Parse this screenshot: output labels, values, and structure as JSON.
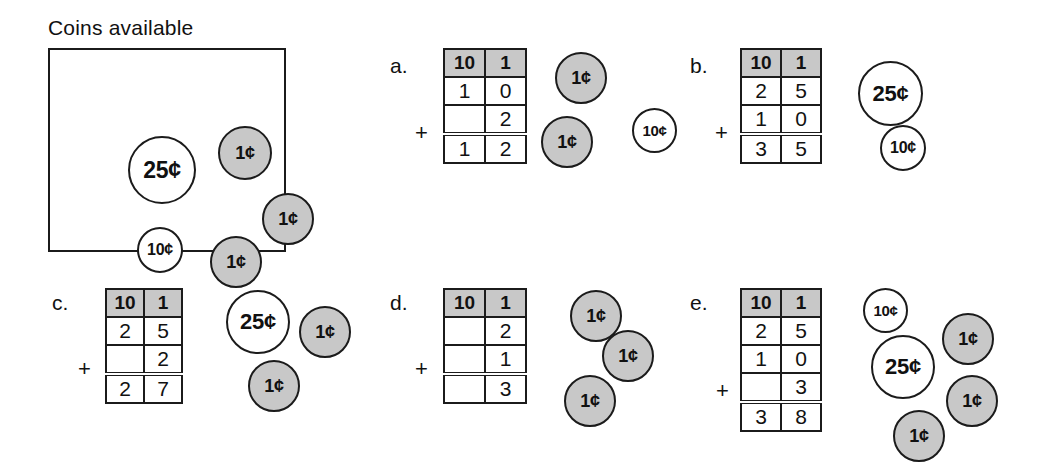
{
  "coins_available": {
    "title": "Coins available",
    "coins": [
      {
        "label": "25¢",
        "type": "quarter",
        "x": 78,
        "y": 86,
        "d": 68
      },
      {
        "label": "1¢",
        "type": "penny",
        "x": 168,
        "y": 76,
        "d": 54
      },
      {
        "label": "1¢",
        "type": "penny",
        "x": 212,
        "y": 143,
        "d": 52
      },
      {
        "label": "10¢",
        "type": "dime",
        "x": 87,
        "y": 177,
        "d": 46
      },
      {
        "label": "1¢",
        "type": "penny",
        "x": 160,
        "y": 186,
        "d": 52
      }
    ]
  },
  "colors": {
    "penny_fill": "#c8c8c8",
    "coin_stroke": "#1b1b1b",
    "header_fill": "#c8c8c8",
    "background": "#ffffff",
    "text": "#111111"
  },
  "table_headers": {
    "tens": "10",
    "ones": "1"
  },
  "plus_symbol": "+",
  "panels": [
    {
      "id": "a",
      "letter": "a.",
      "rows": [
        {
          "tens": "1",
          "ones": "0"
        },
        {
          "tens": "",
          "ones": "2"
        }
      ],
      "sum": {
        "tens": "1",
        "ones": "2"
      },
      "coins": [
        {
          "label": "1¢",
          "type": "penny",
          "x": 555,
          "y": 52,
          "d": 52
        },
        {
          "label": "1¢",
          "type": "penny",
          "x": 541,
          "y": 116,
          "d": 52
        },
        {
          "label": "10¢",
          "type": "dime",
          "x": 632,
          "y": 108,
          "d": 45
        }
      ]
    },
    {
      "id": "b",
      "letter": "b.",
      "rows": [
        {
          "tens": "2",
          "ones": "5"
        },
        {
          "tens": "1",
          "ones": "0"
        }
      ],
      "sum": {
        "tens": "3",
        "ones": "5"
      },
      "coins": [
        {
          "label": "25¢",
          "type": "quarter",
          "x": 858,
          "y": 61,
          "d": 65
        },
        {
          "label": "10¢",
          "type": "dime",
          "x": 880,
          "y": 125,
          "d": 46
        }
      ]
    },
    {
      "id": "c",
      "letter": "c.",
      "rows": [
        {
          "tens": "2",
          "ones": "5"
        },
        {
          "tens": "",
          "ones": "2"
        }
      ],
      "sum": {
        "tens": "2",
        "ones": "7"
      },
      "coins": [
        {
          "label": "25¢",
          "type": "quarter",
          "x": 226,
          "y": 290,
          "d": 64
        },
        {
          "label": "1¢",
          "type": "penny",
          "x": 299,
          "y": 306,
          "d": 52
        },
        {
          "label": "1¢",
          "type": "penny",
          "x": 248,
          "y": 360,
          "d": 52
        }
      ]
    },
    {
      "id": "d",
      "letter": "d.",
      "rows": [
        {
          "tens": "",
          "ones": "2"
        },
        {
          "tens": "",
          "ones": "1"
        }
      ],
      "sum": {
        "tens": "",
        "ones": "3"
      },
      "coins": [
        {
          "label": "1¢",
          "type": "penny",
          "x": 570,
          "y": 290,
          "d": 52
        },
        {
          "label": "1¢",
          "type": "penny",
          "x": 602,
          "y": 330,
          "d": 52
        },
        {
          "label": "1¢",
          "type": "penny",
          "x": 564,
          "y": 375,
          "d": 52
        }
      ]
    },
    {
      "id": "e",
      "letter": "e.",
      "rows": [
        {
          "tens": "2",
          "ones": "5"
        },
        {
          "tens": "1",
          "ones": "0"
        },
        {
          "tens": "",
          "ones": "3"
        }
      ],
      "sum": {
        "tens": "3",
        "ones": "8"
      },
      "coins": [
        {
          "label": "10¢",
          "type": "dime",
          "x": 863,
          "y": 288,
          "d": 45
        },
        {
          "label": "1¢",
          "type": "penny",
          "x": 942,
          "y": 313,
          "d": 52
        },
        {
          "label": "25¢",
          "type": "quarter",
          "x": 871,
          "y": 335,
          "d": 64
        },
        {
          "label": "1¢",
          "type": "penny",
          "x": 946,
          "y": 375,
          "d": 52
        },
        {
          "label": "1¢",
          "type": "penny",
          "x": 893,
          "y": 410,
          "d": 52
        }
      ]
    }
  ]
}
